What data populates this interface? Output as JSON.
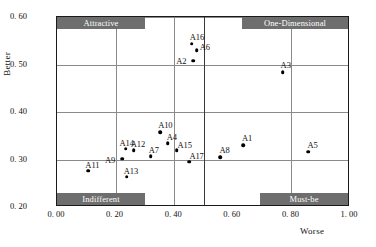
{
  "chart_data": {
    "type": "scatter",
    "title": "",
    "xlabel": "Worse",
    "ylabel": "Better",
    "xlim": [
      0.0,
      1.0
    ],
    "ylim": [
      0.2,
      0.6
    ],
    "grid": true,
    "xticks": [
      "0. 00",
      "0. 20",
      "0. 40",
      "0. 60",
      "0. 80",
      "1. 00"
    ],
    "xtick_values": [
      0.0,
      0.2,
      0.4,
      0.6,
      0.8,
      1.0
    ],
    "yticks": [
      "0. 20",
      "0. 30",
      "0. 40",
      "0. 50",
      "0. 60"
    ],
    "ytick_values": [
      0.2,
      0.3,
      0.4,
      0.5,
      0.6
    ],
    "gridlines_x": [
      0.2,
      0.4,
      0.5,
      0.8
    ],
    "gridlines_y": [
      0.3,
      0.4,
      0.5,
      0.6
    ],
    "divider_x": 0.5,
    "legend": "none",
    "points": [
      {
        "label": "A1",
        "x": 0.635,
        "y": 0.33,
        "label_dx": -1,
        "label_dy": -11
      },
      {
        "label": "A2",
        "x": 0.465,
        "y": 0.508,
        "label_dx": -17,
        "label_dy": -4
      },
      {
        "label": "A3",
        "x": 0.77,
        "y": 0.484,
        "label_dx": -2,
        "label_dy": -11
      },
      {
        "label": "A4",
        "x": 0.378,
        "y": 0.334,
        "label_dx": -1,
        "label_dy": -10
      },
      {
        "label": "A5",
        "x": 0.858,
        "y": 0.316,
        "label_dx": -1,
        "label_dy": -11
      },
      {
        "label": "A6",
        "x": 0.477,
        "y": 0.53,
        "label_dx": 3,
        "label_dy": -7
      },
      {
        "label": "A7",
        "x": 0.32,
        "y": 0.307,
        "label_dx": -2,
        "label_dy": -10
      },
      {
        "label": "A8",
        "x": 0.558,
        "y": 0.305,
        "label_dx": -1,
        "label_dy": -11
      },
      {
        "label": "A9",
        "x": 0.222,
        "y": 0.302,
        "label_dx": -17,
        "label_dy": -3
      },
      {
        "label": "A10",
        "x": 0.352,
        "y": 0.357,
        "label_dx": -2,
        "label_dy": -11
      },
      {
        "label": "A11",
        "x": 0.107,
        "y": 0.276,
        "label_dx": -3,
        "label_dy": -10
      },
      {
        "label": "A12",
        "x": 0.262,
        "y": 0.319,
        "label_dx": -3,
        "label_dy": -10
      },
      {
        "label": "A13",
        "x": 0.238,
        "y": 0.264,
        "label_dx": -3,
        "label_dy": -10
      },
      {
        "label": "A14",
        "x": 0.234,
        "y": 0.323,
        "label_dx": -6,
        "label_dy": -10
      },
      {
        "label": "A15",
        "x": 0.408,
        "y": 0.32,
        "label_dx": 1,
        "label_dy": -9
      },
      {
        "label": "A16",
        "x": 0.46,
        "y": 0.544,
        "label_dx": -2,
        "label_dy": -11
      },
      {
        "label": "A17",
        "x": 0.452,
        "y": 0.295,
        "label_dx": 0,
        "label_dy": -10
      },
      {
        "label": "A18",
        "x": 0.66,
        "y": 0.58,
        "label_dx": -3,
        "label_dy": -11
      }
    ]
  },
  "quadrants": {
    "attractive": "Attractive",
    "one_dimensional": "One-Dimensional",
    "indifferent": "Indifferent",
    "must_be": "Must-be"
  },
  "colors": {
    "quadrant_box_bg": "#6e6e6e",
    "quadrant_box_text": "#ffffff",
    "gridline": "#8a8a8a",
    "gridline_strong": "#3a3a3a",
    "frame": "#1a1a1a",
    "point": "#000000"
  }
}
